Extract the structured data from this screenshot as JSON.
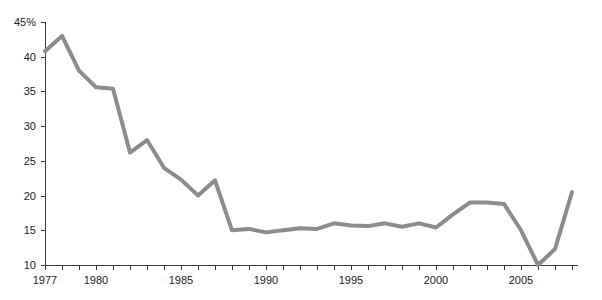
{
  "chart_data": {
    "type": "line",
    "title": "",
    "subtitle": "",
    "xlabel": "",
    "ylabel": "",
    "x": [
      1977,
      1978,
      1979,
      1980,
      1981,
      1982,
      1983,
      1984,
      1985,
      1986,
      1987,
      1988,
      1989,
      1990,
      1991,
      1992,
      1993,
      1994,
      1995,
      1996,
      1997,
      1998,
      1999,
      2000,
      2001,
      2002,
      2003,
      2004,
      2005,
      2006,
      2007,
      2008
    ],
    "values": [
      40.8,
      43.0,
      38.0,
      35.6,
      35.4,
      26.2,
      28.0,
      24.0,
      22.3,
      20.0,
      22.2,
      15.0,
      15.2,
      14.7,
      15.0,
      15.3,
      15.2,
      16.0,
      15.7,
      15.6,
      16.0,
      15.5,
      16.0,
      15.4,
      17.3,
      19.0,
      19.0,
      18.8,
      15.0,
      10.0,
      12.3,
      20.5
    ],
    "series": [
      {
        "name": "rate",
        "color": "#8c8c8c",
        "values": [
          40.8,
          43.0,
          38.0,
          35.6,
          35.4,
          26.2,
          28.0,
          24.0,
          22.3,
          20.0,
          22.2,
          15.0,
          15.2,
          14.7,
          15.0,
          15.3,
          15.2,
          16.0,
          15.7,
          15.6,
          16.0,
          15.5,
          16.0,
          15.4,
          17.3,
          19.0,
          19.0,
          18.8,
          15.0,
          10.0,
          12.3,
          20.5
        ]
      }
    ],
    "xlim": [
      1976.5,
      2008.6
    ],
    "ylim": [
      10,
      45
    ],
    "grid": false,
    "legend": null,
    "legend_position": "none",
    "y_ticks": [
      10,
      15,
      20,
      25,
      30,
      35,
      40,
      45
    ],
    "y_tick_labels": [
      "10",
      "15",
      "20",
      "25",
      "30",
      "35",
      "40",
      "45%"
    ],
    "x_ticks": [
      1977,
      1978,
      1979,
      1980,
      1981,
      1982,
      1983,
      1984,
      1985,
      1986,
      1987,
      1988,
      1989,
      1990,
      1991,
      1992,
      1993,
      1994,
      1995,
      1996,
      1997,
      1998,
      1999,
      2000,
      2001,
      2002,
      2003,
      2004,
      2005,
      2006,
      2007,
      2008
    ],
    "x_tick_labels_shown": [
      {
        "value": 1977,
        "label": "1977"
      },
      {
        "value": 1980,
        "label": "1980"
      },
      {
        "value": 1985,
        "label": "1985"
      },
      {
        "value": 1990,
        "label": "1990"
      },
      {
        "value": 1995,
        "label": "1995"
      },
      {
        "value": 2000,
        "label": "2000"
      },
      {
        "value": 2005,
        "label": "2005"
      }
    ],
    "line_color": "#8c8c8c",
    "line_width": 4,
    "axis_color": "#3a3a3a",
    "background_color": "#ffffff"
  }
}
